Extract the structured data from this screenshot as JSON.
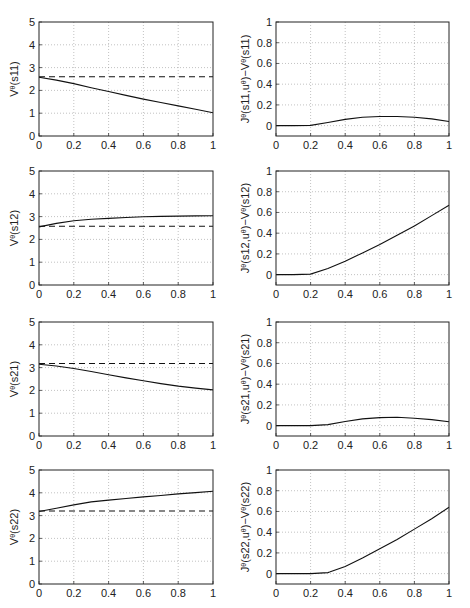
{
  "figure": {
    "layout": "4 rows x 2 columns",
    "x_ticks": [
      "0",
      "0.2",
      "0.4",
      "0.6",
      "0.8",
      "1"
    ]
  },
  "chart_data": [
    {
      "id": "V_s11",
      "type": "line",
      "row": 0,
      "col": 0,
      "ylabel": "V^θ(s11)",
      "ylabel_main": "V",
      "ylabel_sup": "θ",
      "ylabel_arg": "(s11)",
      "xlim": [
        0,
        1
      ],
      "ylim": [
        0,
        5
      ],
      "grid": true,
      "yticks": [
        0,
        1,
        2,
        3,
        4,
        5
      ],
      "ytick_labels": [
        "0",
        "1",
        "2",
        "3",
        "4",
        "5"
      ],
      "x": [
        0,
        0.1,
        0.2,
        0.3,
        0.4,
        0.5,
        0.6,
        0.7,
        0.8,
        0.9,
        1.0
      ],
      "series": [
        {
          "name": "solid",
          "style": "solid",
          "values": [
            2.58,
            2.45,
            2.3,
            2.12,
            1.95,
            1.78,
            1.62,
            1.47,
            1.32,
            1.17,
            1.02
          ]
        },
        {
          "name": "dashed",
          "style": "dashed",
          "values": [
            2.6,
            2.6,
            2.6,
            2.6,
            2.6,
            2.6,
            2.6,
            2.6,
            2.6,
            2.6,
            2.6
          ]
        }
      ]
    },
    {
      "id": "J_s11",
      "type": "line",
      "row": 0,
      "col": 1,
      "ylabel": "J^θ(s11,u^θ)−V^θ(s11)",
      "ylabel_main": "J",
      "ylabel_sup": "θ",
      "ylabel_arg": "(s11,u",
      "ylabel_sup2": "θ",
      "ylabel_rest": ")−V",
      "ylabel_sup3": "θ",
      "ylabel_end": "(s11)",
      "xlim": [
        0,
        1
      ],
      "ylim": [
        -0.1,
        1
      ],
      "grid": true,
      "yticks": [
        0,
        0.2,
        0.4,
        0.6,
        0.8,
        1
      ],
      "ytick_labels": [
        "0",
        "0.2",
        "0.4",
        "0.6",
        "0.8",
        "1"
      ],
      "x": [
        0,
        0.1,
        0.2,
        0.3,
        0.4,
        0.5,
        0.6,
        0.7,
        0.8,
        0.9,
        1.0
      ],
      "series": [
        {
          "name": "difference",
          "style": "solid",
          "values": [
            0,
            0,
            0.002,
            0.03,
            0.06,
            0.08,
            0.088,
            0.088,
            0.08,
            0.065,
            0.04
          ]
        }
      ]
    },
    {
      "id": "V_s12",
      "type": "line",
      "row": 1,
      "col": 0,
      "ylabel": "V^θ(s12)",
      "ylabel_main": "V",
      "ylabel_sup": "θ",
      "ylabel_arg": "(s12)",
      "xlim": [
        0,
        1
      ],
      "ylim": [
        0,
        5
      ],
      "grid": true,
      "yticks": [
        0,
        1,
        2,
        3,
        4,
        5
      ],
      "ytick_labels": [
        "0",
        "1",
        "2",
        "3",
        "4",
        "5"
      ],
      "x": [
        0,
        0.1,
        0.2,
        0.3,
        0.4,
        0.5,
        0.6,
        0.7,
        0.8,
        0.9,
        1.0
      ],
      "series": [
        {
          "name": "solid",
          "style": "solid",
          "values": [
            2.55,
            2.7,
            2.82,
            2.88,
            2.92,
            2.96,
            2.99,
            3.01,
            3.02,
            3.03,
            3.04
          ]
        },
        {
          "name": "dashed",
          "style": "dashed",
          "values": [
            2.58,
            2.58,
            2.58,
            2.58,
            2.58,
            2.58,
            2.58,
            2.58,
            2.58,
            2.58,
            2.58
          ]
        }
      ]
    },
    {
      "id": "J_s12",
      "type": "line",
      "row": 1,
      "col": 1,
      "ylabel": "J^θ(s12,u^θ)−V^θ(s12)",
      "ylabel_main": "J",
      "ylabel_sup": "θ",
      "ylabel_arg": "(s12,u",
      "ylabel_sup2": "θ",
      "ylabel_rest": ")−V",
      "ylabel_sup3": "θ",
      "ylabel_end": "(s12)",
      "xlim": [
        0,
        1
      ],
      "ylim": [
        -0.1,
        1
      ],
      "grid": true,
      "yticks": [
        0,
        0.2,
        0.4,
        0.6,
        0.8,
        1
      ],
      "ytick_labels": [
        "0",
        "0.2",
        "0.4",
        "0.6",
        "0.8",
        "1"
      ],
      "x": [
        0,
        0.1,
        0.2,
        0.3,
        0.4,
        0.5,
        0.6,
        0.7,
        0.8,
        0.9,
        1.0
      ],
      "series": [
        {
          "name": "difference",
          "style": "solid",
          "values": [
            0,
            0,
            0.005,
            0.06,
            0.13,
            0.21,
            0.29,
            0.38,
            0.47,
            0.57,
            0.67
          ]
        }
      ]
    },
    {
      "id": "V_s21",
      "type": "line",
      "row": 2,
      "col": 0,
      "ylabel": "V^θ(s21)",
      "ylabel_main": "V",
      "ylabel_sup": "θ",
      "ylabel_arg": "(s21)",
      "xlim": [
        0,
        1
      ],
      "ylim": [
        0,
        5
      ],
      "grid": true,
      "yticks": [
        0,
        1,
        2,
        3,
        4,
        5
      ],
      "ytick_labels": [
        "0",
        "1",
        "2",
        "3",
        "4",
        "5"
      ],
      "x": [
        0,
        0.1,
        0.2,
        0.3,
        0.4,
        0.5,
        0.6,
        0.7,
        0.8,
        0.9,
        1.0
      ],
      "series": [
        {
          "name": "solid",
          "style": "solid",
          "values": [
            3.15,
            3.07,
            2.96,
            2.83,
            2.69,
            2.55,
            2.42,
            2.3,
            2.19,
            2.1,
            2.02
          ]
        },
        {
          "name": "dashed",
          "style": "dashed",
          "values": [
            3.18,
            3.18,
            3.18,
            3.18,
            3.18,
            3.18,
            3.18,
            3.18,
            3.18,
            3.18,
            3.18
          ]
        }
      ]
    },
    {
      "id": "J_s21",
      "type": "line",
      "row": 2,
      "col": 1,
      "ylabel": "J^θ(s21,u^θ)−V^θ(s21)",
      "ylabel_main": "J",
      "ylabel_sup": "θ",
      "ylabel_arg": "(s21,u",
      "ylabel_sup2": "θ",
      "ylabel_rest": ")−V",
      "ylabel_sup3": "θ",
      "ylabel_end": "(s21)",
      "xlim": [
        0,
        1
      ],
      "ylim": [
        -0.1,
        1
      ],
      "grid": true,
      "yticks": [
        0,
        0.2,
        0.4,
        0.6,
        0.8,
        1
      ],
      "ytick_labels": [
        "0",
        "0.2",
        "0.4",
        "0.6",
        "0.8",
        "1"
      ],
      "x": [
        0,
        0.1,
        0.2,
        0.3,
        0.4,
        0.5,
        0.6,
        0.7,
        0.8,
        0.9,
        1.0
      ],
      "series": [
        {
          "name": "difference",
          "style": "solid",
          "values": [
            0,
            0,
            0,
            0.01,
            0.04,
            0.065,
            0.078,
            0.08,
            0.072,
            0.058,
            0.038
          ]
        }
      ]
    },
    {
      "id": "V_s22",
      "type": "line",
      "row": 3,
      "col": 0,
      "ylabel": "V^θ(s22)",
      "ylabel_main": "V",
      "ylabel_sup": "θ",
      "ylabel_arg": "(s22)",
      "xlim": [
        0,
        1
      ],
      "ylim": [
        0,
        5
      ],
      "grid": true,
      "yticks": [
        0,
        1,
        2,
        3,
        4,
        5
      ],
      "ytick_labels": [
        "0",
        "1",
        "2",
        "3",
        "4",
        "5"
      ],
      "x": [
        0,
        0.1,
        0.2,
        0.3,
        0.4,
        0.5,
        0.6,
        0.7,
        0.8,
        0.9,
        1.0
      ],
      "series": [
        {
          "name": "solid",
          "style": "solid",
          "values": [
            3.18,
            3.32,
            3.47,
            3.6,
            3.68,
            3.75,
            3.82,
            3.88,
            3.95,
            4.01,
            4.07
          ]
        },
        {
          "name": "dashed",
          "style": "dashed",
          "values": [
            3.2,
            3.2,
            3.2,
            3.2,
            3.2,
            3.2,
            3.2,
            3.2,
            3.2,
            3.2,
            3.2
          ]
        }
      ]
    },
    {
      "id": "J_s22",
      "type": "line",
      "row": 3,
      "col": 1,
      "ylabel": "J^θ(s22,u^θ)−V^θ(s22)",
      "ylabel_main": "J",
      "ylabel_sup": "θ",
      "ylabel_arg": "(s22,u",
      "ylabel_sup2": "θ",
      "ylabel_rest": ")−V",
      "ylabel_sup3": "θ",
      "ylabel_end": "(s22)",
      "xlim": [
        0,
        1
      ],
      "ylim": [
        -0.1,
        1
      ],
      "grid": true,
      "yticks": [
        0,
        0.2,
        0.4,
        0.6,
        0.8,
        1
      ],
      "ytick_labels": [
        "0",
        "0.2",
        "0.4",
        "0.6",
        "0.8",
        "1"
      ],
      "x": [
        0,
        0.1,
        0.2,
        0.3,
        0.31,
        0.4,
        0.5,
        0.6,
        0.7,
        0.8,
        0.9,
        1.0
      ],
      "series": [
        {
          "name": "difference",
          "style": "solid",
          "values": [
            0,
            0,
            0,
            0.01,
            0.015,
            0.07,
            0.15,
            0.24,
            0.33,
            0.43,
            0.53,
            0.64
          ]
        }
      ]
    }
  ]
}
